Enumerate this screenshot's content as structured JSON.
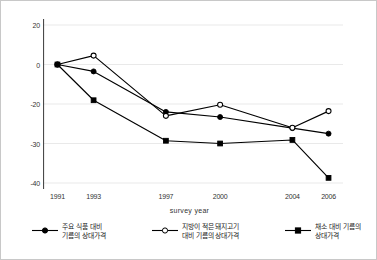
{
  "chart_data": {
    "type": "line",
    "title": "",
    "xlabel": "survey year",
    "ylabel": "",
    "categories": [
      "1991",
      "1993",
      "1997",
      "2000",
      "2004",
      "2006"
    ],
    "x": [
      1991,
      1993,
      1997,
      2000,
      2004,
      2006
    ],
    "xlim": [
      1990.2,
      2006.8
    ],
    "ylim": [
      -42,
      22
    ],
    "yticks": [
      20,
      0,
      -20,
      -30,
      -40
    ],
    "ytick_labels": [
      "20",
      "0",
      "-20",
      "-30",
      "-40"
    ],
    "grid": "horizontal-faint",
    "legend_position": "below",
    "series": [
      {
        "name": "주요 식품 대비 기름의 상대가격",
        "marker": "filled-circle",
        "color": "#000000",
        "values": [
          0,
          -3.5,
          -22.0,
          -23.3,
          -26.1,
          -27.5
        ]
      },
      {
        "name": "지방이 적은 돼지고기 대비 기름의 상대가격",
        "marker": "open-circle",
        "color": "#000000",
        "values": [
          0,
          4.5,
          -23.0,
          -20.2,
          -26.0,
          -21.8
        ]
      },
      {
        "name": "채소 대비 기름의 상대가격",
        "marker": "filled-square",
        "color": "#000000",
        "values": [
          0,
          -18.1,
          -29.3,
          -30.0,
          -29.1,
          -38.7
        ]
      }
    ]
  },
  "axis": {
    "x_title": "survey year"
  },
  "legend": {
    "items": [
      {
        "line1": "주요 식품 대비",
        "line2": "기름의 상대가격",
        "marker": "filled-circle"
      },
      {
        "line1": "지방이 적은 돼지고기",
        "line2": "대비 기름의 상대가격",
        "marker": "open-circle"
      },
      {
        "line1": "채소 대비 기름의",
        "line2": "상대가격",
        "marker": "filled-square"
      }
    ]
  }
}
